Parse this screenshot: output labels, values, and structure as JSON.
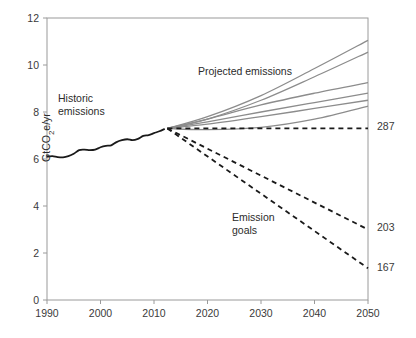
{
  "chart_data": {
    "type": "line",
    "title": "",
    "xlabel": "",
    "ylabel": "GtCO2e/yr",
    "ylabel_rich": {
      "pre": "GtCO",
      "sub": "2",
      "post": "e/yr"
    },
    "xlim": [
      1990,
      2050
    ],
    "ylim": [
      0,
      12
    ],
    "xticks": [
      1990,
      2000,
      2010,
      2020,
      2030,
      2040,
      2050
    ],
    "xtick_labels": [
      "1990",
      "2000",
      "2010",
      "2020",
      "2030",
      "2040",
      "2050"
    ],
    "yticks": [
      0,
      2,
      4,
      6,
      8,
      10,
      12
    ],
    "ytick_labels": [
      "0",
      "2",
      "4",
      "6",
      "8",
      "10",
      "12"
    ],
    "grid": false,
    "legend": "none",
    "annotations": [
      {
        "id": "historic",
        "text": "Historic emissions",
        "line1": "Historic",
        "line2": "emissions",
        "x": 1995.5,
        "y": 8.1
      },
      {
        "id": "projected",
        "text": "Projected emissions",
        "x": 2021.0,
        "y": 9.6
      },
      {
        "id": "goals",
        "text": "Emission goals",
        "line1": "Emission",
        "line2": "goals",
        "x": 2028.0,
        "y": 2.9
      }
    ],
    "end_labels": [
      {
        "id": "end-287",
        "value": "287",
        "year": 2050,
        "y": 7.3
      },
      {
        "id": "end-203",
        "value": "203",
        "year": 2050,
        "y": 3.0
      },
      {
        "id": "end-167",
        "value": "167",
        "year": 2050,
        "y": 1.35
      }
    ],
    "divergence_point": {
      "year": 2012.5,
      "y": 7.3
    },
    "series": [
      {
        "name": "Historic emissions",
        "style": "solid",
        "color": "#1a1a1a",
        "width": 1.8,
        "x": [
          1990,
          1991,
          1992,
          1993,
          1994,
          1995,
          1996,
          1997,
          1998,
          1999,
          2000,
          2001,
          2002,
          2003,
          2004,
          2005,
          2006,
          2007,
          2008,
          2009,
          2010,
          2011,
          2012
        ],
        "y": [
          6.1,
          6.12,
          6.08,
          6.07,
          6.12,
          6.22,
          6.38,
          6.4,
          6.38,
          6.4,
          6.5,
          6.56,
          6.58,
          6.72,
          6.8,
          6.84,
          6.8,
          6.86,
          6.98,
          7.02,
          7.1,
          7.18,
          7.28
        ]
      },
      {
        "name": "Projection A (highest)",
        "style": "solid",
        "color": "#8c8c8c",
        "width": 1.3,
        "x": [
          2012.5,
          2020,
          2030,
          2040,
          2050
        ],
        "y": [
          7.3,
          7.8,
          8.7,
          9.85,
          11.05
        ]
      },
      {
        "name": "Projection B",
        "style": "solid",
        "color": "#8c8c8c",
        "width": 1.3,
        "x": [
          2012.5,
          2020,
          2030,
          2040,
          2050
        ],
        "y": [
          7.3,
          7.7,
          8.5,
          9.5,
          10.55
        ]
      },
      {
        "name": "Projection C",
        "style": "solid",
        "color": "#8c8c8c",
        "width": 1.3,
        "x": [
          2012.5,
          2020,
          2030,
          2040,
          2050
        ],
        "y": [
          7.3,
          7.7,
          8.3,
          8.8,
          9.25
        ]
      },
      {
        "name": "Projection D",
        "style": "solid",
        "color": "#8c8c8c",
        "width": 1.3,
        "x": [
          2012.5,
          2020,
          2030,
          2040,
          2050
        ],
        "y": [
          7.3,
          7.58,
          8.0,
          8.4,
          8.8
        ]
      },
      {
        "name": "Projection E",
        "style": "solid",
        "color": "#8c8c8c",
        "width": 1.3,
        "x": [
          2012.5,
          2020,
          2030,
          2040,
          2050
        ],
        "y": [
          7.3,
          7.48,
          7.8,
          8.15,
          8.5
        ]
      },
      {
        "name": "Projection F (lowest)",
        "style": "solid",
        "color": "#8c8c8c",
        "width": 1.3,
        "x": [
          2012.5,
          2020,
          2030,
          2040,
          2050
        ],
        "y": [
          7.3,
          7.25,
          7.35,
          7.7,
          8.25
        ]
      },
      {
        "name": "Goal 287 (flat)",
        "style": "dashed",
        "color": "#1a1a1a",
        "width": 1.8,
        "x": [
          2012.5,
          2050
        ],
        "y": [
          7.3,
          7.3
        ]
      },
      {
        "name": "Goal 203",
        "style": "dashed",
        "color": "#1a1a1a",
        "width": 1.8,
        "x": [
          2012.5,
          2050
        ],
        "y": [
          7.3,
          3.0
        ]
      },
      {
        "name": "Goal 167",
        "style": "dashed",
        "color": "#1a1a1a",
        "width": 1.8,
        "x": [
          2012.5,
          2050
        ],
        "y": [
          7.3,
          1.35
        ]
      }
    ]
  }
}
